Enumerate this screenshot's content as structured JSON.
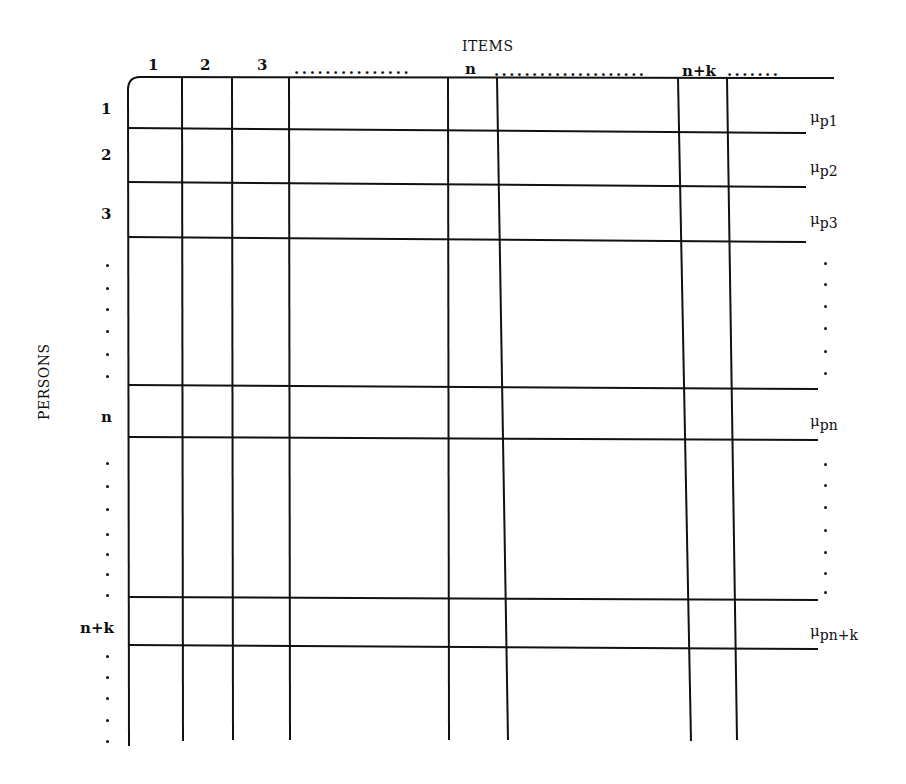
{
  "diagram": {
    "title_items": "ITEMS",
    "title_persons": "PERSONS",
    "columns": [
      {
        "label": "1",
        "x": 152
      },
      {
        "label": "2",
        "x": 204
      },
      {
        "label": "3",
        "x": 258
      },
      {
        "label": "n",
        "x": 466
      },
      {
        "label": "n+k",
        "x": 690
      }
    ],
    "column_ellipses": [
      "...............",
      "....................",
      "......."
    ],
    "rows": [
      {
        "label": "1",
        "y": 102
      },
      {
        "label": "2",
        "y": 148
      },
      {
        "label": "3",
        "y": 208
      },
      {
        "label": "n",
        "y": 412
      },
      {
        "label": "n+k",
        "y": 622
      }
    ],
    "row_means": [
      {
        "symbol": "μ",
        "sub": "p1",
        "y": 110
      },
      {
        "symbol": "μ",
        "sub": "p2",
        "y": 160
      },
      {
        "symbol": "μ",
        "sub": "p3",
        "y": 214
      },
      {
        "symbol": "μ",
        "sub": "pn",
        "y": 416
      },
      {
        "symbol": "μ",
        "sub": "pn+k",
        "y": 624
      }
    ],
    "grid": {
      "vertical_x": [
        128,
        182,
        232,
        289,
        448,
        508,
        680,
        737
      ],
      "horizontal_y": [
        128,
        183,
        238,
        385,
        437,
        597,
        645
      ],
      "top_y": 76,
      "bottom_y": 742,
      "right_x": 818,
      "line_color": "#111111"
    }
  }
}
